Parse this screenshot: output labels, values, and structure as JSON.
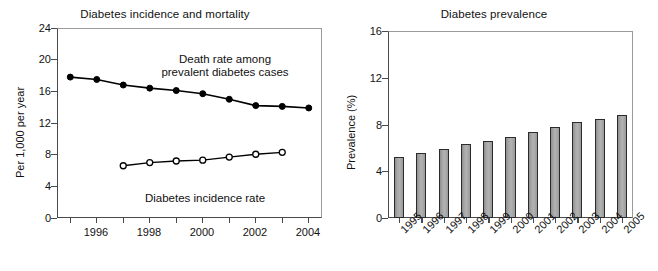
{
  "figure": {
    "background_color": "#ffffff",
    "text_color": "#111111"
  },
  "panels": [
    {
      "name": "diabetes-incidence-and-mortality",
      "title": "Diabetes incidence and mortality",
      "ylabel": "Per 1,000 per year"
    },
    {
      "name": "diabetes-prevalence",
      "title": "Diabetes prevalence",
      "ylabel": "Prevalence (%)"
    }
  ],
  "left": {
    "title": "Diabetes incidence and mortality",
    "ylabel": "Per 1,000 per year",
    "yticks": [
      "0",
      "4",
      "8",
      "12",
      "16",
      "20",
      "24"
    ],
    "xticks": [
      "1996",
      "1998",
      "2000",
      "2002",
      "2004"
    ],
    "annotation_death_line1": "Death rate among",
    "annotation_death_line2": "prevalent diabetes cases",
    "annotation_incidence": "Diabetes incidence rate"
  },
  "right": {
    "title": "Diabetes prevalence",
    "ylabel": "Prevalence (%)",
    "yticks": [
      "0",
      "4",
      "8",
      "12",
      "16"
    ],
    "xticks": [
      "1995",
      "1996",
      "1997",
      "1998",
      "1999",
      "2000",
      "2001",
      "2002",
      "2003",
      "2004",
      "2005"
    ],
    "bar_color": "#a6a6a6",
    "bar_edge_color": "#2b2b2b"
  },
  "chart_data": [
    {
      "type": "line",
      "title": "Diabetes incidence and mortality",
      "xlabel": "",
      "ylabel": "Per 1,000 per year",
      "xlim": [
        1995.0,
        2005.0
      ],
      "ylim": [
        0,
        24
      ],
      "yticks": [
        0,
        4,
        8,
        12,
        16,
        20,
        24
      ],
      "xticks": [
        1996,
        1998,
        2000,
        2002,
        2004
      ],
      "xtick_minor": [
        1995,
        1996,
        1997,
        1998,
        1999,
        2000,
        2001,
        2002,
        2003,
        2004
      ],
      "grid": false,
      "legend": "annotations-inline",
      "series": [
        {
          "name": "Death rate among prevalent diabetes cases",
          "marker": "filled-circle",
          "color": "#000000",
          "x": [
            1995.5,
            1996.5,
            1997.5,
            1998.5,
            1999.5,
            2000.5,
            2001.5,
            2002.5,
            2003.5,
            2004.5
          ],
          "values": [
            17.8,
            17.5,
            16.8,
            16.4,
            16.1,
            15.7,
            15.0,
            14.2,
            14.1,
            13.9
          ]
        },
        {
          "name": "Diabetes incidence rate",
          "marker": "open-circle",
          "color": "#000000",
          "x": [
            1997.5,
            1998.5,
            1999.5,
            2000.5,
            2001.5,
            2002.5,
            2003.5
          ],
          "values": [
            6.6,
            7.0,
            7.2,
            7.3,
            7.7,
            8.05,
            8.3
          ]
        }
      ]
    },
    {
      "type": "bar",
      "title": "Diabetes prevalence",
      "xlabel": "",
      "ylabel": "Prevalence (%)",
      "categories": [
        "1995",
        "1996",
        "1997",
        "1998",
        "1999",
        "2000",
        "2001",
        "2002",
        "2003",
        "2004",
        "2005"
      ],
      "values": [
        5.2,
        5.6,
        5.9,
        6.3,
        6.6,
        6.9,
        7.4,
        7.8,
        8.2,
        8.5,
        8.8
      ],
      "ylim": [
        0,
        16
      ],
      "yticks": [
        0,
        4,
        8,
        12,
        16
      ],
      "grid": false,
      "legend": "none",
      "bar_color": "#a6a6a6",
      "bar_edge_color": "#2b2b2b"
    }
  ]
}
